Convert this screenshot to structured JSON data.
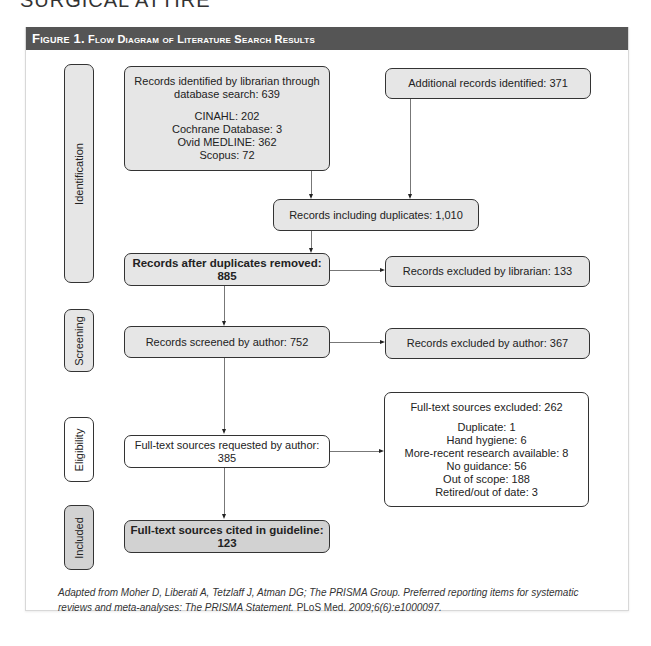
{
  "running_header": "SURGICAL ATTIRE",
  "figure": {
    "label": "Figure 1.",
    "title": "Flow Diagram of Literature Search Results"
  },
  "phases": {
    "identification": "Identification",
    "screening": "Screening",
    "eligibility": "Eligibility",
    "included": "Included"
  },
  "boxes": {
    "librarian_search": {
      "line1": "Records identified by librarian through",
      "line2": "database search: 639",
      "sources": [
        "CINAHL: 202",
        "Cochrane Database: 3",
        "Ovid MEDLINE: 362",
        "Scopus: 72"
      ]
    },
    "additional_records": "Additional records identified: 371",
    "including_duplicates": "Records including duplicates: 1,010",
    "after_duplicates": "Records after duplicates removed: 885",
    "excluded_librarian": "Records excluded by librarian: 133",
    "screened_author": "Records screened by author: 752",
    "excluded_author": "Records excluded by author: 367",
    "fulltext_requested": "Full-text sources requested by author: 385",
    "fulltext_excluded": {
      "title": "Full-text sources excluded: 262",
      "reasons": [
        "Duplicate: 1",
        "Hand hygiene: 6",
        "More-recent research available: 8",
        "No guidance: 56",
        "Out of scope: 188",
        "Retired/out of date: 3"
      ]
    },
    "cited": "Full-text sources cited in guideline: 123"
  },
  "caption": {
    "part1": "Adapted from Moher D, Liberati A, Tetzlaff J, Atman DG; The PRISMA Group. Preferred reporting items for systematic reviews and meta-analyses: The PRISMA Statement. ",
    "journal": "PLoS Med.",
    "part2": " 2009;6(6):e1000097."
  },
  "colors": {
    "header_bar": "#555555",
    "box_gray": "#e6e6e6",
    "box_dark_gray": "#d2d2d2",
    "box_white": "#ffffff",
    "border": "#333333",
    "connector": "#777777"
  }
}
